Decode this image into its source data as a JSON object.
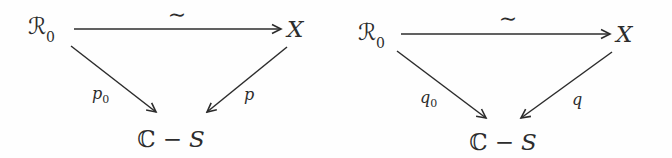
{
  "figure": {
    "ink_color": "#2c2c2c",
    "background_color": "#fefefe"
  },
  "diagrams": [
    {
      "top_left_main": "ℛ",
      "top_left_sub": "0",
      "top_arrow_label": "∼",
      "top_right": "X",
      "left_arrow_label_main": "p",
      "left_arrow_label_sub": "0",
      "right_arrow_label": "p",
      "bottom_c": "ℂ",
      "bottom_minus": "−",
      "bottom_s": "S"
    },
    {
      "top_left_main": "ℛ",
      "top_left_sub": "0",
      "top_arrow_label": "∼",
      "top_right": "X",
      "left_arrow_label_main": "q",
      "left_arrow_label_sub": "0",
      "right_arrow_label": "q",
      "bottom_c": "ℂ",
      "bottom_minus": "−",
      "bottom_s": "S"
    }
  ]
}
